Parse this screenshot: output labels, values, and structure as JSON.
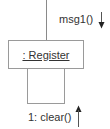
{
  "diagram": {
    "type": "UML communication diagram",
    "object": {
      "label": ": Register"
    },
    "messages": [
      {
        "label": "msg1()",
        "direction": "down",
        "icon": "arrow-down-icon"
      },
      {
        "label": "1: clear()",
        "direction": "up",
        "icon": "arrow-up-icon"
      }
    ],
    "colors": {
      "line": "#8a8a8a",
      "box_border": "#9a9a9a",
      "text": "#333333",
      "arrow": "#222222"
    }
  }
}
